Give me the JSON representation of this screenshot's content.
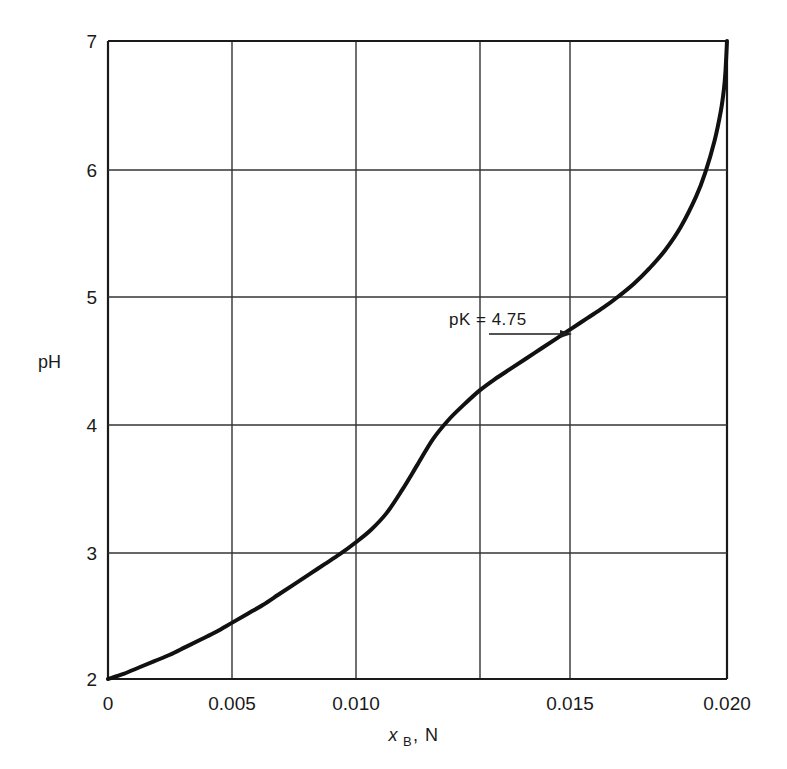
{
  "chart_data": {
    "type": "line",
    "title": "",
    "subtitle": "",
    "xlabel": "x B, N",
    "xlabel_parts": {
      "symbol": "x",
      "subscript": "B",
      "separator": ",",
      "units": "N"
    },
    "ylabel": "pH",
    "xlim": [
      0,
      0.02
    ],
    "ylim": [
      2,
      7
    ],
    "grid": true,
    "legend": null,
    "xticks": [
      0,
      0.005,
      0.01,
      0.015,
      0.02
    ],
    "xtick_labels": [
      "0",
      "0.005",
      "0.010",
      "0.015",
      "0.020"
    ],
    "yticks": [
      2,
      3,
      4,
      5,
      6,
      7
    ],
    "ytick_labels": [
      "2",
      "3",
      "4",
      "5",
      "6",
      "7"
    ],
    "series": [
      {
        "name": "titration curve",
        "color": "#111111",
        "x": [
          0.0,
          0.0005,
          0.001,
          0.0015,
          0.002,
          0.0025,
          0.003,
          0.0035,
          0.004,
          0.0045,
          0.005,
          0.0055,
          0.006,
          0.0065,
          0.007,
          0.0075,
          0.008,
          0.0085,
          0.009,
          0.0095,
          0.01,
          0.0105,
          0.011,
          0.0115,
          0.012,
          0.0125,
          0.013,
          0.0135,
          0.014,
          0.0145,
          0.015,
          0.0155,
          0.016,
          0.0165,
          0.017,
          0.0175,
          0.018,
          0.0185,
          0.019,
          0.0193,
          0.0196,
          0.0198,
          0.0199,
          0.01995,
          0.02
        ],
        "y": [
          2.0,
          2.04,
          2.09,
          2.14,
          2.19,
          2.25,
          2.31,
          2.37,
          2.44,
          2.51,
          2.58,
          2.66,
          2.74,
          2.82,
          2.9,
          2.98,
          3.07,
          3.17,
          3.3,
          3.48,
          3.68,
          3.88,
          4.03,
          4.15,
          4.26,
          4.35,
          4.43,
          4.51,
          4.59,
          4.67,
          4.75,
          4.83,
          4.91,
          5.0,
          5.1,
          5.22,
          5.36,
          5.54,
          5.78,
          5.97,
          6.22,
          6.45,
          6.62,
          6.76,
          7.0
        ]
      }
    ],
    "annotations": [
      {
        "name": "pk-annotation",
        "text": "pK = 4.75",
        "point_x": 0.015,
        "point_y": 4.75,
        "arrow": true,
        "arrow_direction": "right"
      }
    ]
  },
  "figure": {
    "background_color": "#ffffff",
    "line_color": "#111111",
    "grid_color": "#2a2a2a",
    "axis_color": "#111111"
  }
}
